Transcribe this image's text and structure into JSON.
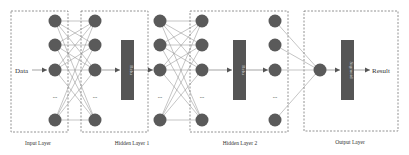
{
  "diagram": {
    "title": "",
    "input_label": "Data",
    "output_label": "Result",
    "ellipsis": "...",
    "layers": [
      {
        "name": "Input Layer"
      },
      {
        "name": "Hidden Layer 1"
      },
      {
        "name": "Hidden Layer 2"
      },
      {
        "name": "Output Layer"
      }
    ],
    "activations": [
      {
        "label": "Relu"
      },
      {
        "label": "Relu"
      },
      {
        "label": "Sigmoid"
      }
    ],
    "colors": {
      "node": "#5a5a5a",
      "activation_box": "#555555",
      "edge": "#8a8a8a",
      "dashed_border": "#777777",
      "text": "#333333"
    }
  }
}
